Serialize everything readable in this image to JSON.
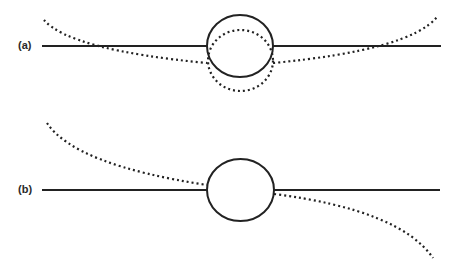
{
  "panels": [
    {
      "label": "(a)",
      "description": "Horizontal solid line through circle with dotted symmetric curve bending down and dotted lower circle"
    },
    {
      "label": "(b)",
      "description": "Horizontal solid line through circle with antisymmetric dotted curve"
    }
  ],
  "colors": {
    "stroke": "#222222",
    "background": "#ffffff"
  }
}
